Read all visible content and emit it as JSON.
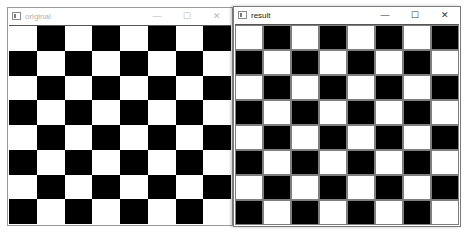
{
  "windows": [
    {
      "title": "original",
      "active": false,
      "controls": {
        "minimize": "—",
        "maximize": "☐",
        "close": "✕"
      },
      "board": {
        "rows": 8,
        "cols": 8,
        "top_left": "white",
        "dark": "#000000",
        "light": "#ffffff",
        "grid_lines": false
      }
    },
    {
      "title": "result",
      "active": true,
      "controls": {
        "minimize": "—",
        "maximize": "☐",
        "close": "✕"
      },
      "board": {
        "rows": 8,
        "cols": 8,
        "top_left": "white",
        "dark": "#000000",
        "light": "#ffffff",
        "grid_lines": true,
        "grid_color": "#7f7f7f"
      }
    }
  ]
}
